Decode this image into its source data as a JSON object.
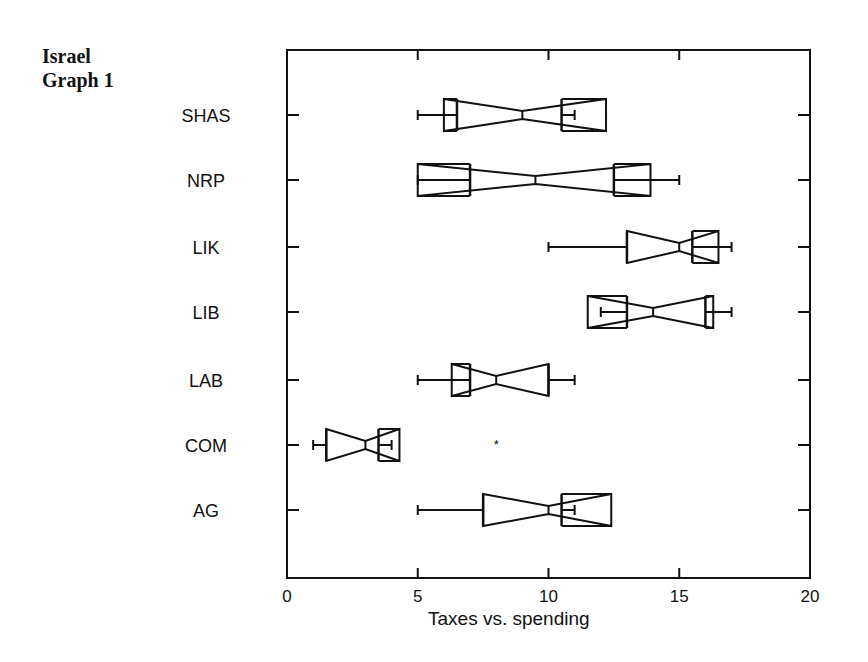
{
  "title": {
    "line1": "Israel",
    "line2": "Graph 1"
  },
  "chart_data": {
    "type": "boxplot",
    "orientation": "horizontal",
    "title": "Israel Graph 1",
    "xlabel": "Taxes vs. spending",
    "ylabel": "",
    "xlim": [
      0,
      20
    ],
    "xticks": [
      0,
      5,
      10,
      15,
      20
    ],
    "grid": false,
    "notched": true,
    "categories": [
      "SHAS",
      "NRP",
      "LIK",
      "LIB",
      "LAB",
      "COM",
      "AG"
    ],
    "series": [
      {
        "name": "SHAS",
        "whisker_low": 5,
        "q1": 6.5,
        "notch_low": 6.0,
        "median": 9,
        "notch_high": 12.2,
        "q3": 10.5,
        "whisker_high": 11
      },
      {
        "name": "NRP",
        "whisker_low": 5,
        "q1": 7,
        "notch_low": 5.0,
        "median": 9.5,
        "notch_high": 13.9,
        "q3": 12.5,
        "whisker_high": 15
      },
      {
        "name": "LIK",
        "whisker_low": 10,
        "q1": 13,
        "notch_low": 13.0,
        "median": 15,
        "notch_high": 16.5,
        "q3": 15.5,
        "whisker_high": 17
      },
      {
        "name": "LIB",
        "whisker_low": 12,
        "q1": 13,
        "notch_low": 11.5,
        "median": 14,
        "notch_high": 16.3,
        "q3": 16,
        "whisker_high": 17
      },
      {
        "name": "LAB",
        "whisker_low": 5,
        "q1": 7,
        "notch_low": 6.3,
        "median": 8,
        "notch_high": 10,
        "q3": 10,
        "whisker_high": 11
      },
      {
        "name": "COM",
        "whisker_low": 1,
        "q1": 1.5,
        "notch_low": 1.5,
        "median": 3,
        "notch_high": 4.3,
        "q3": 3.5,
        "whisker_high": 4,
        "outliers": [
          8
        ]
      },
      {
        "name": "AG",
        "whisker_low": 5,
        "q1": 7.5,
        "notch_low": 7.5,
        "median": 10,
        "notch_high": 12.4,
        "q3": 10.5,
        "whisker_high": 11
      }
    ]
  }
}
